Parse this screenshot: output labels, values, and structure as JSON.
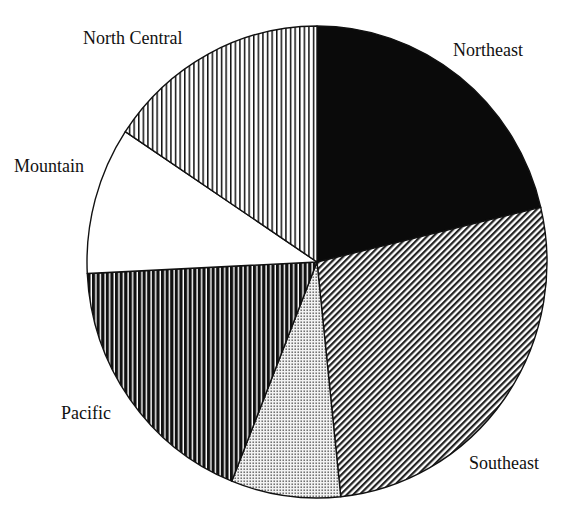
{
  "chart_data": {
    "type": "pie",
    "title": "",
    "start_angle_deg": 0,
    "direction": "clockwise",
    "unit": "percent (estimated from slice angles)",
    "categories": [
      "Northeast",
      "Southeast",
      "(unlabeled)",
      "Pacific",
      "Mountain",
      "North Central"
    ],
    "values": [
      21.3,
      27.1,
      7.7,
      18.2,
      10.1,
      15.7
    ],
    "slices": [
      {
        "label": "Northeast",
        "value": 21.3,
        "fill": "solid-black",
        "show_label": true
      },
      {
        "label": "Southeast",
        "value": 27.1,
        "fill": "diagonal-hatch",
        "show_label": true
      },
      {
        "label": "",
        "value": 7.7,
        "fill": "dots",
        "show_label": false
      },
      {
        "label": "Pacific",
        "value": 18.2,
        "fill": "thick-vertical-stripes",
        "show_label": true
      },
      {
        "label": "Mountain",
        "value": 10.1,
        "fill": "white",
        "show_label": true
      },
      {
        "label": "North Central",
        "value": 15.7,
        "fill": "thin-vertical-stripes",
        "show_label": true
      }
    ],
    "legend": "none (labels placed outside slices)"
  },
  "labels": {
    "northeast": "Northeast",
    "southeast": "Southeast",
    "pacific": "Pacific",
    "mountain": "Mountain",
    "north_central": "North Central"
  },
  "colors": {
    "ink": "#111111",
    "background": "#ffffff"
  }
}
